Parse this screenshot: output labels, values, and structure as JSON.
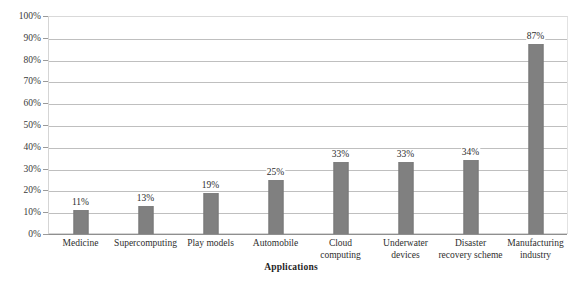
{
  "chart_data": {
    "type": "bar",
    "title": "",
    "subtitle": "",
    "xlabel": "Applications",
    "ylabel": "",
    "ylim": [
      0,
      100
    ],
    "grid": true,
    "legend": "none",
    "orientation": "vertical",
    "unit": "%",
    "bar_color": "#808080",
    "gridline_color": "#bfbfbf",
    "axis_color": "#9a9a9a",
    "categories": [
      "Medicine",
      "Supercomputing",
      "Play models",
      "Automobile",
      "Cloud computing",
      "Underwater devices",
      "Disaster recovery scheme",
      "Manufacturing industry"
    ],
    "values": [
      11,
      13,
      19,
      25,
      33,
      33,
      34,
      87
    ],
    "data_labels": [
      "11%",
      "13%",
      "19%",
      "25%",
      "33%",
      "33%",
      "34%",
      "87%"
    ],
    "yticks": [
      0,
      10,
      20,
      30,
      40,
      50,
      60,
      70,
      80,
      90,
      100
    ],
    "ytick_labels": [
      "0%",
      "10%",
      "20%",
      "30%",
      "40%",
      "50%",
      "60%",
      "70%",
      "80%",
      "90%",
      "100%"
    ]
  }
}
